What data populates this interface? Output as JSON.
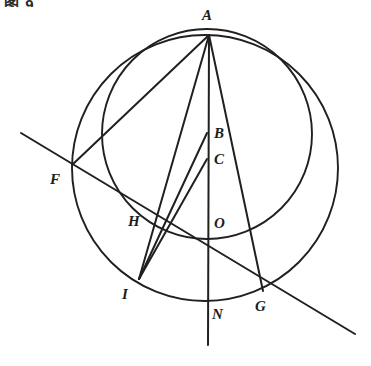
{
  "figure": {
    "corner_note": "图 9",
    "ink_color": "#20201f",
    "background_color": "#ffffff",
    "type": "euclidean-geometry-figure"
  },
  "points": [
    {
      "id": "A",
      "label": "A",
      "x": 209,
      "y": 35,
      "label_x": 202,
      "label_y": 8
    },
    {
      "id": "B",
      "label": "B",
      "x": 207,
      "y": 133,
      "label_x": 214,
      "label_y": 126
    },
    {
      "id": "C",
      "label": "C",
      "x": 207,
      "y": 159,
      "label_x": 214,
      "label_y": 152
    },
    {
      "id": "O",
      "label": "O",
      "x": 207,
      "y": 224,
      "label_x": 214,
      "label_y": 216
    },
    {
      "id": "F",
      "label": "F",
      "x": 72,
      "y": 165,
      "label_x": 50,
      "label_y": 172
    },
    {
      "id": "H",
      "label": "H",
      "x": 153,
      "y": 228,
      "label_x": 128,
      "label_y": 214
    },
    {
      "id": "I",
      "label": "I",
      "x": 139,
      "y": 279,
      "label_x": 122,
      "label_y": 287
    },
    {
      "id": "N",
      "label": "N",
      "x": 208,
      "y": 301,
      "label_x": 212,
      "label_y": 307
    },
    {
      "id": "G",
      "label": "G",
      "x": 263,
      "y": 291,
      "label_x": 255,
      "label_y": 299
    }
  ],
  "circles": [
    {
      "id": "outer-circle",
      "name": "outer-circle",
      "cx": 205,
      "cy": 168,
      "r": 133,
      "stroke_width": 1.9
    },
    {
      "id": "inner-circle",
      "name": "inner-circle",
      "cx": 207,
      "cy": 134,
      "r": 105,
      "stroke_width": 1.9
    }
  ],
  "segments": [
    {
      "id": "A-F",
      "name": "segment-a-f",
      "x1": 209,
      "y1": 35,
      "x2": 72,
      "y2": 165
    },
    {
      "id": "A-I",
      "name": "segment-a-i",
      "x1": 209,
      "y1": 35,
      "x2": 139,
      "y2": 279
    },
    {
      "id": "A-N",
      "name": "segment-a-n-vertical",
      "x1": 209,
      "y1": 35,
      "x2": 208,
      "y2": 345
    },
    {
      "id": "A-G",
      "name": "segment-a-g",
      "x1": 209,
      "y1": 35,
      "x2": 263,
      "y2": 291
    },
    {
      "id": "I-B",
      "name": "segment-i-b",
      "x1": 139,
      "y1": 279,
      "x2": 207,
      "y2": 133
    },
    {
      "id": "I-C",
      "name": "segment-i-c",
      "x1": 139,
      "y1": 279,
      "x2": 207,
      "y2": 159
    },
    {
      "id": "F-G-transversal",
      "name": "line-f-g-transversal",
      "x1": 21,
      "y1": 133,
      "x2": 355,
      "y2": 334
    }
  ],
  "labels_note": "Italic serif capitals mark the nine named points"
}
